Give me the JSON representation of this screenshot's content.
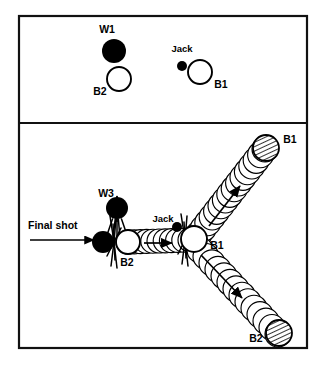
{
  "figure": {
    "kind": "bowls-shot-diagram",
    "background": "#ffffff",
    "ink": "#000000",
    "width": 327,
    "height": 375
  },
  "frame": {
    "outer": {
      "x": 19,
      "y": 16,
      "w": 288,
      "h": 332
    },
    "divider_y": 123,
    "stroke": "#111111",
    "stroke_width": 2.2
  },
  "panels": {
    "before": {
      "name": "before-shot-panel",
      "caption": ""
    },
    "after": {
      "name": "after-shot-panel",
      "caption": ""
    }
  },
  "top_panel": {
    "balls": [
      {
        "id": "w1-ball",
        "label": "W1",
        "fill": "solid",
        "cx": 114,
        "cy": 51,
        "r": 12,
        "label_x": 107,
        "label_y": 33,
        "label_anchor": "middle"
      },
      {
        "id": "b2-ball",
        "label": "B2",
        "fill": "open",
        "cx": 119,
        "cy": 79,
        "r": 12,
        "label_x": 100,
        "label_y": 95,
        "label_anchor": "middle"
      },
      {
        "id": "jack-ball",
        "label": "Jack",
        "fill": "solid",
        "cx": 182,
        "cy": 66,
        "r": 5,
        "label_x": 182,
        "label_y": 52,
        "label_anchor": "middle"
      },
      {
        "id": "b1-ball",
        "label": "B1",
        "fill": "open",
        "cx": 200,
        "cy": 72,
        "r": 12,
        "label_x": 221,
        "label_y": 88,
        "label_anchor": "middle"
      }
    ]
  },
  "bottom_panel": {
    "annotation": {
      "id": "final-shot-annotation",
      "text": "Final shot",
      "text_x": 28,
      "text_y": 229,
      "arrow": {
        "x1": 30,
        "y1": 240,
        "x2": 94,
        "y2": 240
      }
    },
    "balls": [
      {
        "id": "w3-ball",
        "label": "W3",
        "fill": "solid",
        "cx": 117,
        "cy": 208,
        "r": 11,
        "label_x": 106,
        "label_y": 197,
        "label_anchor": "middle"
      },
      {
        "id": "shooter-ball",
        "label": "",
        "fill": "solid",
        "cx": 103,
        "cy": 242,
        "r": 11,
        "label_x": 0,
        "label_y": 0,
        "label_anchor": "middle"
      },
      {
        "id": "b2-struck-ball",
        "label": "B2",
        "fill": "open",
        "cx": 128,
        "cy": 242,
        "r": 12,
        "label_x": 127,
        "label_y": 266,
        "label_anchor": "middle"
      },
      {
        "id": "jack-ball-after",
        "label": "Jack",
        "fill": "solid",
        "cx": 177,
        "cy": 227,
        "r": 5,
        "label_x": 163,
        "label_y": 222,
        "label_anchor": "middle"
      },
      {
        "id": "b1-struck-ball",
        "label": "B1",
        "fill": "open",
        "cx": 194,
        "cy": 239,
        "r": 13,
        "label_x": 217,
        "label_y": 249,
        "label_anchor": "middle"
      },
      {
        "id": "b1-final-ball",
        "label": "B1",
        "fill": "hatched",
        "cx": 266,
        "cy": 148,
        "r": 13,
        "label_x": 290,
        "label_y": 143,
        "label_anchor": "middle"
      },
      {
        "id": "b2-final-ball",
        "label": "B2",
        "fill": "hatched",
        "cx": 279,
        "cy": 333,
        "r": 13,
        "label_x": 256,
        "label_y": 342,
        "label_anchor": "middle"
      }
    ],
    "trails": [
      {
        "id": "trail-b2-to-centre",
        "from": [
          128,
          242
        ],
        "to": [
          190,
          240
        ],
        "count": 11,
        "r": 12,
        "arrow": {
          "x1": 144,
          "y1": 243,
          "x2": 172,
          "y2": 243
        }
      },
      {
        "id": "trail-b1-upper-right",
        "from": [
          199,
          234
        ],
        "to": [
          265,
          149
        ],
        "count": 16,
        "r": 13,
        "arrow": {
          "x1": 209,
          "y1": 226,
          "x2": 240,
          "y2": 186
        }
      },
      {
        "id": "trail-b2-lower-right",
        "from": [
          200,
          250
        ],
        "to": [
          278,
          334
        ],
        "count": 14,
        "r": 13,
        "arrow": {
          "x1": 201,
          "y1": 255,
          "x2": 242,
          "y2": 298
        }
      }
    ],
    "impact_marks": [
      {
        "id": "impact-mark-left",
        "cx": 114,
        "cy": 242
      },
      {
        "id": "impact-mark-centre",
        "cx": 185,
        "cy": 240
      }
    ]
  },
  "legend_text": {
    "w1": "W1",
    "w3": "W3",
    "b1": "B1",
    "b2": "B2",
    "jack": "Jack",
    "final_shot": "Final shot"
  }
}
